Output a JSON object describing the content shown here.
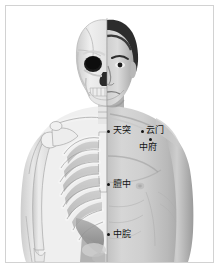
{
  "chart_type": "anatomical-acupuncture-diagram",
  "figure": {
    "title": "",
    "left_half": "skeleton",
    "right_half": "body-surface",
    "orientation": "anterior",
    "colors": {
      "background": "#ffffff",
      "border": "#d2d2d2",
      "marker": "#141414",
      "label_text": "#121212",
      "skin_light": "#d8d8d8",
      "skin_mid": "#b4b4b4",
      "skin_dark": "#8e8e8e",
      "bone_light": "#f2f2f2",
      "bone_shadow": "#9a9a9a",
      "hair_dark": "#2a2a2a"
    }
  },
  "points": [
    {
      "id": "tiantu",
      "label": "天突",
      "dot_x": 108,
      "dot_y": 131,
      "label_x": 114,
      "label_y": 126
    },
    {
      "id": "yunmen",
      "label": "云门",
      "dot_x": 142,
      "dot_y": 131,
      "label_x": 147,
      "label_y": 126
    },
    {
      "id": "zhongfu",
      "label": "中府",
      "dot_x": 150,
      "dot_y": 139,
      "label_x": 140,
      "label_y": 143
    },
    {
      "id": "danzhong",
      "label": "膻中",
      "dot_x": 108,
      "dot_y": 184,
      "label_x": 114,
      "label_y": 180
    },
    {
      "id": "zhongwan",
      "label": "中脘",
      "dot_x": 108,
      "dot_y": 234,
      "label_x": 114,
      "label_y": 230
    }
  ]
}
